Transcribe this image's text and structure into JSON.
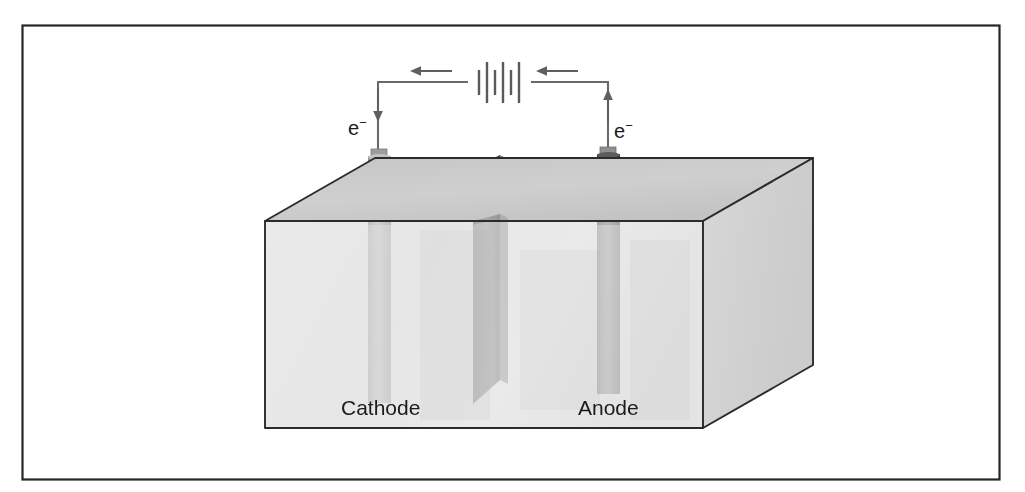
{
  "figure": {
    "border": {
      "name": "figure-border",
      "stroke": "#262626",
      "x": 22,
      "y": 25,
      "width": 978,
      "height": 455
    },
    "background": "#ffffff"
  },
  "circuit": {
    "battery": {
      "name": "battery-symbol",
      "label": "battery",
      "cx": 499,
      "cy": 82,
      "plate_count": 6,
      "stroke": "#5a5a5a"
    },
    "wire": {
      "name": "circuit-wire",
      "stroke": "#6a6a6a",
      "top_y": 82,
      "left_x": 378,
      "right_x": 608
    },
    "current_arrows": [
      {
        "name": "current-arrow-left",
        "label": "current direction left",
        "direction": "left",
        "x": 420,
        "y": 75
      },
      {
        "name": "current-arrow-right",
        "label": "current direction right",
        "direction": "left",
        "x": 540,
        "y": 75
      }
    ],
    "electron_flow": [
      {
        "name": "electron-flow-cathode",
        "label": "e",
        "superscript": "−",
        "direction": "down",
        "arrow_x": 378,
        "arrow_top": 88,
        "arrow_bottom": 118,
        "text_x": 350,
        "text_y": 133
      },
      {
        "name": "electron-flow-anode",
        "label": "e",
        "superscript": "−",
        "direction": "up",
        "arrow_x": 608,
        "arrow_top": 88,
        "arrow_bottom": 122,
        "text_x": 614,
        "text_y": 136
      }
    ]
  },
  "tank": {
    "name": "electrolyte-tank",
    "label": "electrolyte bath",
    "colors": {
      "front_face": "#d2d2d2",
      "top_face": "#c9c9c9",
      "right_face": "#cfcfcf",
      "edge": "#2b2b2b"
    },
    "geometry": {
      "front_left_x": 265,
      "front_right_x": 703,
      "front_top_y": 221,
      "front_bottom_y": 428,
      "depth_dx": 110,
      "depth_dy": -63
    }
  },
  "electrodes": [
    {
      "name": "cathode-electrode",
      "label": "Cathode",
      "type": "rod",
      "color_top": "#b5b5b5",
      "color_body": "#a8a8a8",
      "color_highlight": "#cfcfcf",
      "cx": 379,
      "top_y": 148,
      "bottom_y": 224,
      "width": 22,
      "cap_color": "#9a9a9a",
      "submerged_tint": "#bfbfbf",
      "submerged_bottom_y": 403,
      "label_x": 341,
      "label_y": 414
    },
    {
      "name": "anode-electrode",
      "label": "Anode",
      "type": "rod",
      "color_top": "#4a4a4a",
      "color_body": "#414141",
      "color_highlight": "#6d6d6d",
      "cx": 608,
      "top_y": 146,
      "bottom_y": 224,
      "width": 22,
      "cap_color": "#8c8c8c",
      "submerged_tint": "#9b9b9b",
      "submerged_bottom_y": 394,
      "label_x": 579,
      "label_y": 414
    }
  ],
  "workpiece": {
    "name": "workpiece-plate",
    "label": "plate",
    "color_face": "#4f4f4f",
    "color_edge": "#8f8f8f",
    "color_submerged": "#8e8e8e",
    "top_y": 155,
    "waterline_y": 224,
    "bottom_y": 404
  },
  "labels": {
    "cathode": "Cathode",
    "anode": "Anode",
    "electron": "e",
    "electron_charge": "−"
  },
  "colors": {
    "ink": "#1b1b1b",
    "wire": "#6a6a6a",
    "tank_outline": "#2b2b2b",
    "paper": "#ffffff"
  }
}
